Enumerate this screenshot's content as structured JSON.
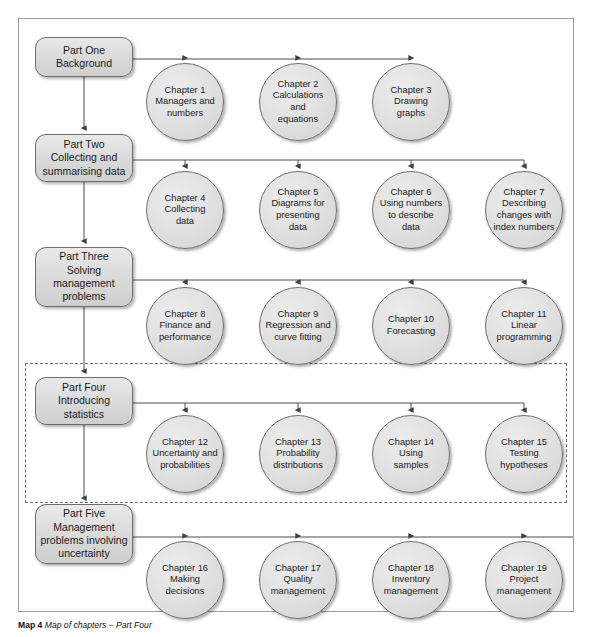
{
  "figure": {
    "caption_label": "Map 4",
    "caption_text": "Map of chapters – Part Four",
    "frame_color": "#9b9b9b",
    "node_fill": "#e0e0e0",
    "node_stroke": "#6d6d6d",
    "connector_color": "#4d4d4d",
    "highlight_style": "dashed"
  },
  "rows": [
    {
      "part": {
        "name": "part-one",
        "label": "Part One\nBackground",
        "highlighted": false
      },
      "chapters": [
        {
          "label": "Chapter 1\nManagers and\nnumbers"
        },
        {
          "label": "Chapter 2\nCalculations and\nequations"
        },
        {
          "label": "Chapter 3\nDrawing\ngraphs"
        }
      ]
    },
    {
      "part": {
        "name": "part-two",
        "label": "Part Two\nCollecting and\nsummarising data",
        "highlighted": false
      },
      "chapters": [
        {
          "label": "Chapter 4\nCollecting\ndata"
        },
        {
          "label": "Chapter 5\nDiagrams for\npresenting\ndata"
        },
        {
          "label": "Chapter 6\nUsing numbers\nto describe\ndata"
        },
        {
          "label": "Chapter 7\nDescribing\nchanges with\nindex numbers"
        }
      ]
    },
    {
      "part": {
        "name": "part-three",
        "label": "Part Three\nSolving\nmanagement\nproblems",
        "highlighted": false
      },
      "chapters": [
        {
          "label": "Chapter 8\nFinance and\nperformance"
        },
        {
          "label": "Chapter 9\nRegression and\ncurve fitting"
        },
        {
          "label": "Chapter 10\nForecasting"
        },
        {
          "label": "Chapter 11\nLinear\nprogramming"
        }
      ]
    },
    {
      "part": {
        "name": "part-four",
        "label": "Part Four\nIntroducing\nstatistics",
        "highlighted": true
      },
      "chapters": [
        {
          "label": "Chapter 12\nUncertainty and\nprobabilities"
        },
        {
          "label": "Chapter 13\nProbability\ndistributions"
        },
        {
          "label": "Chapter 14\nUsing\nsamples"
        },
        {
          "label": "Chapter 15\nTesting\nhypotheses"
        }
      ]
    },
    {
      "part": {
        "name": "part-five",
        "label": "Part Five\nManagement\nproblems involving\nuncertainty",
        "highlighted": false
      },
      "chapters": [
        {
          "label": "Chapter 16\nMaking\ndecisions"
        },
        {
          "label": "Chapter 17\nQuality\nmanagement"
        },
        {
          "label": "Chapter 18\nInventory\nmanagement"
        },
        {
          "label": "Chapter 19\nProject\nmanagement"
        },
        {
          "label": "Chapter 20\nQueues and\nsimulation"
        }
      ]
    }
  ]
}
